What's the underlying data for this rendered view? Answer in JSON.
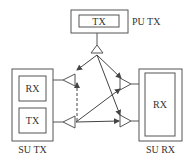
{
  "diagram": {
    "pu_tx": {
      "inner_label": "TX",
      "label": "PU TX"
    },
    "su_tx": {
      "upper_inner_label": "RX",
      "lower_inner_label": "TX",
      "label": "SU TX"
    },
    "su_rx": {
      "inner_label": "RX",
      "label": "SU RX"
    },
    "colors": {
      "stroke": "#555555",
      "text": "#333333",
      "background": "#ffffff"
    }
  }
}
